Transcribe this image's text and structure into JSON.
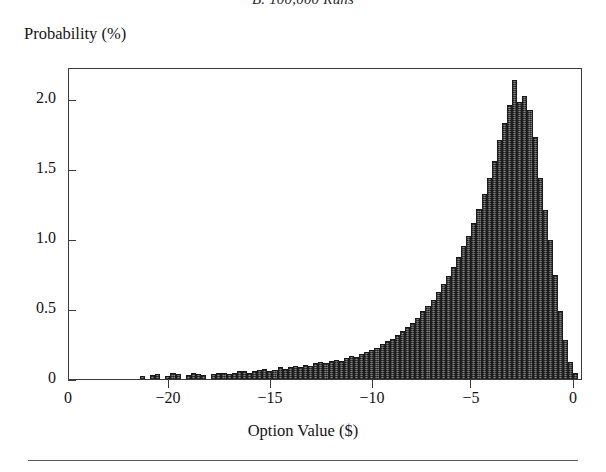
{
  "figure": {
    "panel_title": "B. 100,000 Runs",
    "y_caption": "Probability (%)",
    "x_caption": "Option Value ($)"
  },
  "axes": {
    "y_ticks": [
      "0",
      "0.5",
      "1.0",
      "1.5",
      "2.0"
    ],
    "x_ticks": [
      "0",
      "−20",
      "−15",
      "−10",
      "−5",
      "0"
    ]
  },
  "colors": {
    "bar_fill": "#555456",
    "bar_edge": "#1d1d1d",
    "frame": "#3a3a3a",
    "text": "#131313"
  },
  "chart_data": {
    "type": "bar",
    "title": "B. 100,000 Runs",
    "xlabel": "Option Value ($)",
    "ylabel": "Probability (%)",
    "xlim": [
      -25.1,
      0.1
    ],
    "ylim": [
      0,
      2.4
    ],
    "ytick_values": [
      0,
      0.5,
      1.0,
      1.5,
      2.0
    ],
    "xtick_values": [
      -25,
      -20,
      -15,
      -10,
      -5,
      0
    ],
    "grid": false,
    "legend": null,
    "bin_width": 0.25,
    "x": [
      -21.5,
      -21.25,
      -21.0,
      -20.75,
      -20.5,
      -20.25,
      -20.0,
      -19.75,
      -19.5,
      -19.25,
      -19.0,
      -18.75,
      -18.5,
      -18.25,
      -18.0,
      -17.75,
      -17.5,
      -17.25,
      -17.0,
      -16.75,
      -16.5,
      -16.25,
      -16.0,
      -15.75,
      -15.5,
      -15.25,
      -15.0,
      -14.75,
      -14.5,
      -14.25,
      -14.0,
      -13.75,
      -13.5,
      -13.25,
      -13.0,
      -12.75,
      -12.5,
      -12.25,
      -12.0,
      -11.75,
      -11.5,
      -11.25,
      -11.0,
      -10.75,
      -10.5,
      -10.25,
      -10.0,
      -9.75,
      -9.5,
      -9.25,
      -9.0,
      -8.75,
      -8.5,
      -8.25,
      -8.0,
      -7.75,
      -7.5,
      -7.25,
      -7.0,
      -6.75,
      -6.5,
      -6.25,
      -6.0,
      -5.75,
      -5.5,
      -5.25,
      -5.0,
      -4.75,
      -4.5,
      -4.25,
      -4.0,
      -3.75,
      -3.5,
      -3.25,
      -3.0,
      -2.75,
      -2.5,
      -2.25,
      -2.0,
      -1.75,
      -1.5,
      -1.25,
      -1.0,
      -0.75,
      -0.5,
      -0.25
    ],
    "values": [
      0.02,
      0.0,
      0.03,
      0.04,
      0.0,
      0.02,
      0.05,
      0.04,
      0.0,
      0.03,
      0.05,
      0.04,
      0.03,
      0.0,
      0.04,
      0.05,
      0.05,
      0.04,
      0.05,
      0.06,
      0.06,
      0.05,
      0.06,
      0.07,
      0.08,
      0.06,
      0.07,
      0.09,
      0.08,
      0.09,
      0.1,
      0.09,
      0.11,
      0.1,
      0.12,
      0.13,
      0.12,
      0.14,
      0.15,
      0.14,
      0.16,
      0.18,
      0.17,
      0.19,
      0.21,
      0.22,
      0.24,
      0.27,
      0.29,
      0.31,
      0.34,
      0.37,
      0.4,
      0.43,
      0.47,
      0.52,
      0.56,
      0.61,
      0.67,
      0.73,
      0.79,
      0.86,
      0.94,
      1.02,
      1.1,
      1.2,
      1.31,
      1.42,
      1.55,
      1.68,
      1.84,
      1.97,
      2.11,
      2.3,
      2.13,
      2.18,
      2.07,
      1.86,
      1.55,
      1.3,
      1.07,
      0.8,
      0.52,
      0.3,
      0.13,
      0.05
    ]
  }
}
